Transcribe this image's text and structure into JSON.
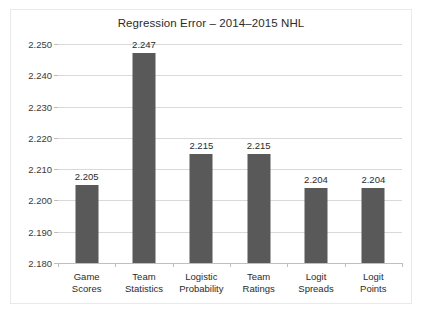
{
  "chart_data": {
    "type": "bar",
    "title": "Regression Error – 2014–2015 NHL",
    "xlabel": "",
    "ylabel": "",
    "categories": [
      "Game Scores",
      "Team Statistics",
      "Logistic Probability",
      "Team Ratings",
      "Logit Spreads",
      "Logit Points"
    ],
    "category_lines": [
      [
        "Game",
        "Scores"
      ],
      [
        "Team",
        "Statistics"
      ],
      [
        "Logistic",
        "Probability"
      ],
      [
        "Team",
        "Ratings"
      ],
      [
        "Logit",
        "Spreads"
      ],
      [
        "Logit",
        "Points"
      ]
    ],
    "values": [
      2.205,
      2.247,
      2.215,
      2.215,
      2.204,
      2.204
    ],
    "value_labels": [
      "2.205",
      "2.247",
      "2.215",
      "2.215",
      "2.204",
      "2.204"
    ],
    "ylim": [
      2.18,
      2.25
    ],
    "ytick_values": [
      2.25,
      2.24,
      2.23,
      2.22,
      2.21,
      2.2,
      2.19,
      2.18
    ],
    "ytick_labels": [
      "2.250",
      "2.240",
      "2.230",
      "2.220",
      "2.210",
      "2.200",
      "2.190",
      "2.180"
    ],
    "grid": true,
    "legend": null,
    "bar_color": "#595959",
    "grid_color": "#d9d9d9",
    "axis_color": "#bfbfbf",
    "text_color": "#2b2b2b",
    "plot_background": "#ffffff",
    "frame_border_color": "#e9e9e9"
  }
}
